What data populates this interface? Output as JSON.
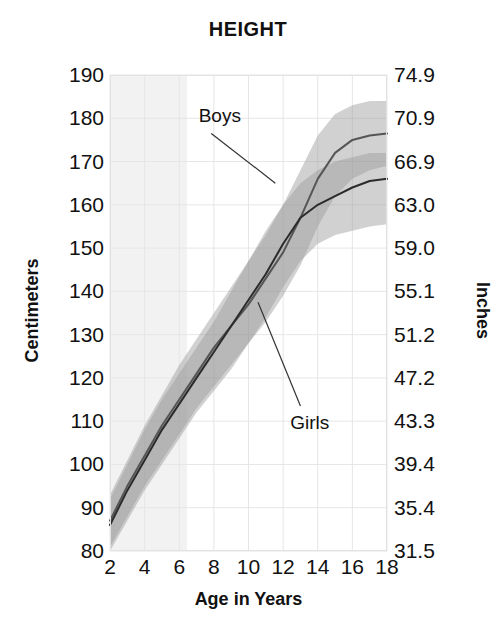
{
  "chart": {
    "title": "HEIGHT",
    "xlabel": "Age in Years",
    "ylabel_left": "Centimeters",
    "ylabel_right": "Inches",
    "boys_label": "Boys",
    "girls_label": "Girls"
  },
  "chart_data": {
    "type": "line",
    "title": "HEIGHT",
    "xlabel": "Age in Years",
    "ylabel": "Centimeters",
    "ylabel_secondary": "Inches",
    "xlim": [
      2,
      18
    ],
    "ylim": [
      80,
      190
    ],
    "ylim_secondary": [
      31.5,
      74.9
    ],
    "grid": true,
    "legend": "inline-annotations",
    "xticks": [
      2,
      4,
      6,
      8,
      10,
      12,
      14,
      16,
      18
    ],
    "yticks_left": [
      190,
      180,
      170,
      160,
      150,
      140,
      130,
      120,
      110,
      100,
      90,
      80
    ],
    "yticks_right": [
      "74.9",
      "70.9",
      "66.9",
      "63.0",
      "59.0",
      "55.1",
      "51.2",
      "47.2",
      "43.3",
      "39.4",
      "35.4",
      "31.5"
    ],
    "x": [
      2,
      3,
      4,
      5,
      6,
      7,
      8,
      9,
      10,
      11,
      12,
      13,
      14,
      15,
      16,
      17,
      18
    ],
    "series": [
      {
        "name": "Boys",
        "color": "#555555",
        "values": [
          87,
          95,
          102,
          109,
          115,
          121,
          127,
          132,
          137,
          143,
          149,
          157,
          166,
          172,
          175,
          176,
          176.5
        ],
        "band_lower": [
          81,
          88,
          95,
          101,
          107,
          113,
          118,
          123,
          128,
          133,
          139,
          146,
          155,
          162,
          166,
          168,
          169
        ],
        "band_upper": [
          93,
          101,
          109,
          116,
          123,
          129,
          135,
          141,
          147,
          153,
          160,
          168,
          176,
          181,
          183,
          184,
          184
        ]
      },
      {
        "name": "Girls",
        "color": "#2b2b2b",
        "values": [
          86,
          94,
          101,
          108,
          114,
          120,
          126,
          132,
          138,
          144,
          151,
          157,
          160,
          162,
          164,
          165.5,
          166
        ],
        "band_lower": [
          80,
          87,
          94,
          100,
          106,
          112,
          117,
          122,
          128,
          134,
          141,
          147,
          151,
          153,
          154,
          155,
          155.5
        ],
        "band_upper": [
          92,
          100,
          108,
          115,
          121,
          127,
          133,
          140,
          147,
          154,
          160,
          165,
          168,
          170,
          171,
          172,
          172
        ]
      }
    ],
    "annotations": [
      {
        "text": "Boys",
        "x": 9.2,
        "y": 180.5
      },
      {
        "text": "Girls",
        "x": 13.1,
        "y": 109.5
      }
    ]
  }
}
